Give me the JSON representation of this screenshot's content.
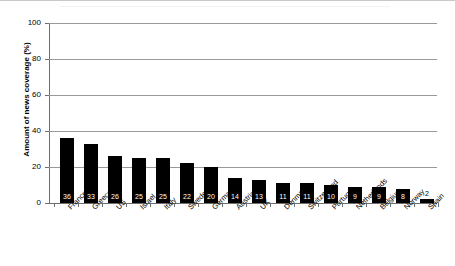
{
  "chart_data": {
    "type": "bar",
    "title": "",
    "xlabel": "",
    "ylabel": "Amount of news coverage (%)",
    "ylim": [
      0,
      100
    ],
    "yticks": [
      0,
      20,
      40,
      60,
      80,
      100
    ],
    "grid": true,
    "legend": "none",
    "bar_color": "#000000",
    "value_label_color_inside": "#ffffff",
    "value_label_color_outside": "#000000",
    "categories": [
      "France",
      "Greece",
      "US",
      "Israel",
      "Italy",
      "Sweden",
      "Germany",
      "Austria",
      "UK",
      "Denmark",
      "Switzerland",
      "Portugal",
      "Netherlands",
      "Belgium",
      "Norway",
      "Spain"
    ],
    "values": [
      36,
      33,
      26,
      25,
      25,
      22,
      20,
      14,
      13,
      11,
      11,
      10,
      9,
      9,
      8,
      2
    ]
  },
  "axes": {
    "y_title": "Amount of news coverage (%)",
    "y_tick_labels": [
      "100",
      "80",
      "60",
      "40",
      "20",
      "0"
    ]
  }
}
